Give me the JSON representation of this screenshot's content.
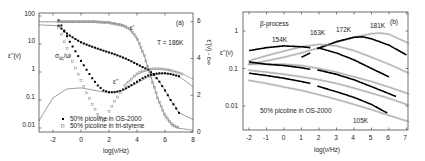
{
  "chart_data": [
    {
      "panel": "(a)",
      "type": "scatter",
      "title": "",
      "xlabel": "log(ν/Hz)",
      "ylabel": "ε''(ν)",
      "ylabel_right": "ε'(ν) - ε∞",
      "xlim": [
        -3,
        8
      ],
      "ylim": [
        0.004,
        100
      ],
      "yscale": "log",
      "ylim_right": [
        0,
        6.5
      ],
      "xticks": [
        -2,
        0,
        2,
        4,
        6,
        8
      ],
      "yticks": [
        "0.01",
        "0.1",
        "1",
        "10",
        "100"
      ],
      "yticks_right": [
        "0",
        "2",
        "4",
        "6"
      ],
      "grid": false,
      "legend_position": "lower-left",
      "annotations": [
        "(a)",
        "T = 186K",
        "σ_dc/ω",
        "ε'",
        "ε''"
      ],
      "series": [
        {
          "name": "50% picoline in OS-2000",
          "marker": "filled-square",
          "color": "#000000",
          "quantity": "ε''",
          "x": [
            -1.6,
            -1.2,
            -0.8,
            -0.4,
            0,
            0.4,
            0.8,
            1.2,
            1.6,
            2.0,
            2.4,
            2.8,
            3.2,
            3.6,
            4.0,
            4.4,
            4.8,
            5.2,
            5.6,
            6.0,
            6.4,
            6.8,
            7.0
          ],
          "values": [
            45,
            28,
            20,
            15,
            11.5,
            9.5,
            8,
            6.8,
            5.8,
            5.0,
            4.3,
            3.6,
            3.0,
            2.4,
            1.9,
            1.5,
            1.2,
            0.8,
            0.45,
            0.22,
            0.1,
            0.05,
            0.035
          ]
        },
        {
          "name": "50% picoline in OS-2000 (σ_dc/ω branch)",
          "marker": "filled-square",
          "color": "#000000",
          "quantity": "ε'' low-frequency conductivity",
          "x": [
            -1.6,
            -1.2,
            -0.8,
            -0.4,
            0,
            0.4,
            0.8,
            1.2,
            1.6,
            2.0,
            2.4,
            2.8,
            3.2,
            3.6,
            4.0,
            4.4,
            4.8,
            5.2,
            5.6,
            6.0,
            6.4,
            6.8,
            7.0
          ],
          "values": [
            70,
            30,
            12,
            5.5,
            2.5,
            1.2,
            0.6,
            0.33,
            0.22,
            0.19,
            0.19,
            0.21,
            0.26,
            0.34,
            0.45,
            0.6,
            0.75,
            0.85,
            0.9,
            0.9,
            0.85,
            0.75,
            0.7
          ]
        },
        {
          "name": "50% picoline in tri-styrene",
          "marker": "open-square",
          "color": "#8a8a8a",
          "quantity": "ε''",
          "x": [
            -1.6,
            -1.2,
            -0.8,
            -0.4,
            0,
            0.4,
            0.8,
            1.2,
            1.6,
            1.8,
            2.0,
            2.4,
            2.8,
            3.2,
            3.6,
            4.0,
            4.4,
            4.8,
            5.2,
            5.6,
            6.0,
            6.4,
            6.8,
            7.2
          ],
          "values": [
            40,
            12,
            4,
            1.4,
            0.5,
            0.18,
            0.07,
            0.03,
            0.018,
            0.02,
            0.04,
            0.09,
            0.18,
            0.32,
            0.55,
            0.85,
            1.1,
            1.25,
            1.3,
            1.3,
            1.25,
            1.15,
            1.0,
            0.85
          ]
        },
        {
          "name": "50% picoline in tri-styrene ε'",
          "marker": "open-square",
          "color": "#8a8a8a",
          "quantity": "ε'(ν) - ε∞ (right axis)",
          "x": [
            -1.6,
            -1,
            0,
            1,
            2,
            3,
            3.5,
            4,
            4.5,
            5,
            5.5,
            6,
            6.5,
            7
          ],
          "values": [
            6.0,
            6.0,
            6.0,
            6.0,
            5.95,
            5.8,
            5.6,
            5.1,
            4.2,
            3.0,
            1.8,
            0.9,
            0.4,
            0.2
          ]
        }
      ],
      "fit_curves": [
        {
          "name": "ε' fit",
          "color": "#555555"
        },
        {
          "name": "ε'' fit OS-2000",
          "color": "#555555"
        },
        {
          "name": "ε'' fit tri-styrene",
          "color": "#555555"
        }
      ]
    },
    {
      "panel": "(b)",
      "type": "scatter",
      "title": "",
      "xlabel": "log(ν/Hz)",
      "ylabel": "ε''(ν)",
      "xlim": [
        -2.3,
        7.3
      ],
      "ylim": [
        0.002,
        3
      ],
      "yscale": "log",
      "xticks": [
        -2,
        -1,
        0,
        1,
        2,
        3,
        4,
        5,
        6,
        7
      ],
      "yticks": [
        "0.01",
        "0.1",
        "1"
      ],
      "grid": false,
      "annotations": [
        "β-process",
        "(b)",
        "154K",
        "163K",
        "172K",
        "181K",
        "105K",
        "50% picoline in OS-2000"
      ],
      "series": [
        {
          "name": "181K",
          "marker": "open-circle",
          "color": "#8a8a8a",
          "x": [
            -2,
            -1,
            0,
            1,
            2,
            3,
            4,
            5,
            5.5,
            6,
            7
          ],
          "values": [
            0.13,
            0.16,
            0.2,
            0.26,
            0.36,
            0.5,
            0.68,
            0.85,
            0.88,
            0.82,
            0.5
          ]
        },
        {
          "name": "172K",
          "marker": "filled-square",
          "color": "#000000",
          "x": [
            1,
            1.5,
            2,
            3,
            4,
            4.5,
            5,
            6,
            7
          ],
          "values": [
            0.2,
            0.26,
            0.35,
            0.52,
            0.68,
            0.7,
            0.62,
            0.42,
            0.23
          ]
        },
        {
          "name": "163K",
          "marker": "open-circle",
          "color": "#8a8a8a",
          "x": [
            -2,
            -1,
            0,
            1,
            2,
            3,
            4,
            5,
            6,
            7
          ],
          "values": [
            0.16,
            0.22,
            0.29,
            0.38,
            0.44,
            0.4,
            0.3,
            0.2,
            0.13,
            0.08
          ]
        },
        {
          "name": "154K",
          "marker": "filled-square",
          "color": "#000000",
          "x": [
            -2,
            -1,
            0,
            1,
            1.5,
            2,
            3,
            4,
            5,
            6
          ],
          "values": [
            0.3,
            0.36,
            0.4,
            0.38,
            0.36,
            0.35,
            0.26,
            0.17,
            0.1,
            0.06
          ]
        },
        {
          "name": "145K",
          "marker": "open-circle",
          "color": "#8a8a8a",
          "x": [
            -2,
            -1,
            0,
            1,
            2,
            3,
            4,
            5,
            6,
            7
          ],
          "values": [
            0.13,
            0.13,
            0.13,
            0.12,
            0.1,
            0.08,
            0.06,
            0.045,
            0.032,
            0.022
          ]
        },
        {
          "name": "135K",
          "marker": "filled-square",
          "color": "#000000",
          "x": [
            -2,
            -1,
            0,
            1,
            1.5,
            2,
            3,
            4,
            5,
            6.4
          ],
          "values": [
            0.15,
            0.13,
            0.12,
            0.105,
            0.095,
            0.09,
            0.07,
            0.05,
            0.033,
            0.018
          ]
        },
        {
          "name": "125K",
          "marker": "open-circle",
          "color": "#8a8a8a",
          "x": [
            -2,
            -1,
            0,
            1,
            2,
            3,
            4,
            5,
            6,
            7
          ],
          "values": [
            0.09,
            0.08,
            0.07,
            0.06,
            0.05,
            0.04,
            0.03,
            0.022,
            0.016,
            0.011
          ]
        },
        {
          "name": "115K",
          "marker": "filled-square",
          "color": "#000000",
          "x": [
            -2,
            -1,
            0,
            1,
            1.5,
            2,
            3,
            4,
            5,
            5.9
          ],
          "values": [
            0.075,
            0.065,
            0.055,
            0.045,
            0.04,
            0.033,
            0.024,
            0.017,
            0.011,
            0.0065
          ]
        },
        {
          "name": "105K",
          "marker": "open-circle",
          "color": "#8a8a8a",
          "x": [
            -2,
            -1,
            0,
            1,
            2,
            3,
            4,
            5,
            6,
            7
          ],
          "values": [
            0.048,
            0.04,
            0.032,
            0.026,
            0.02,
            0.015,
            0.011,
            0.008,
            0.0056,
            0.004
          ]
        }
      ]
    }
  ],
  "figure": {
    "panel_a": {
      "label": "(a)",
      "temperature": "T = 186K",
      "ylabel": "ε''(ν)",
      "ylabel_right": "ε'(ν) - ε∞",
      "xlabel": "log(ν/Hz)",
      "sigma_label": "σdc/ω",
      "sigma_sub": "dc",
      "eps_prime": "ε'",
      "eps_double_prime": "ε''",
      "legend": [
        {
          "label": "50% picoline in OS-2000",
          "marker": "filled-square"
        },
        {
          "label": "50% picoline in tri-styrene",
          "marker": "open-square"
        }
      ],
      "xticks": [
        "-2",
        "0",
        "2",
        "4",
        "6",
        "8"
      ],
      "yticks": [
        "100",
        "10",
        "1",
        "0.1",
        "0.01"
      ],
      "yticks_right": [
        "6",
        "4",
        "2",
        "0"
      ]
    },
    "panel_b": {
      "label": "(b)",
      "process": "β-process",
      "ylabel": "ε''(ν)",
      "xlabel": "log(ν/Hz)",
      "sample": "50% picoline in OS-2000",
      "temps": [
        "154K",
        "163K",
        "172K",
        "181K",
        "105K"
      ],
      "xticks": [
        "-2",
        "-1",
        "0",
        "1",
        "2",
        "3",
        "4",
        "5",
        "6",
        "7"
      ],
      "yticks": [
        "1",
        "0.1",
        "0.01"
      ]
    }
  }
}
